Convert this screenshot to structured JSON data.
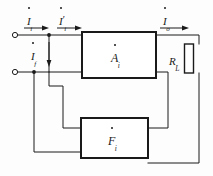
{
  "figure": {
    "type": "negative-feedback-amplifier-block-diagram",
    "background_color": "#fdfdfd",
    "line_color": "#1a1a1a"
  },
  "labels": {
    "input_current": {
      "base": "I",
      "sub": "i",
      "dot": true,
      "prime": ""
    },
    "net_input_current": {
      "base": "I",
      "sub": "i",
      "dot": true,
      "prime": "′"
    },
    "output_current": {
      "base": "I",
      "sub": "o",
      "dot": true,
      "prime": ""
    },
    "feedback_current": {
      "base": "I",
      "sub": "f",
      "dot": true,
      "prime": ""
    },
    "amplifier_block": {
      "base": "A",
      "sub": "i",
      "dot": true,
      "prime": ""
    },
    "feedback_block": {
      "base": "F",
      "sub": "i",
      "dot": true,
      "prime": ""
    },
    "load_resistor": {
      "base": "R",
      "sub": "L",
      "dot": false,
      "prime": ""
    }
  },
  "blocks": [
    {
      "name": "amplifier",
      "label_key": "amplifier_block",
      "x": 82,
      "y": 32,
      "w": 74,
      "h": 46
    },
    {
      "name": "feedback-network",
      "label_key": "feedback_block",
      "x": 81,
      "y": 118,
      "w": 67,
      "h": 40
    }
  ],
  "components": [
    {
      "name": "load-resistor",
      "label_key": "load_resistor",
      "x": 184,
      "y": 44,
      "w": 9,
      "h": 29
    }
  ],
  "terminals": [
    {
      "name": "input-terminal-top",
      "cx": 15,
      "cy": 35,
      "r": 2.6
    },
    {
      "name": "input-terminal-bottom",
      "cx": 15,
      "cy": 72,
      "r": 2.6
    }
  ],
  "junctions": [
    {
      "name": "junction-input-top",
      "cx": 49,
      "cy": 35,
      "r": 1.8
    },
    {
      "name": "junction-input-bottom",
      "cx": 34,
      "cy": 72,
      "r": 1.8
    }
  ],
  "arrows": [
    {
      "name": "arrow-input-current",
      "direction": "right",
      "x1": 24,
      "y1": 28,
      "x2": 46,
      "y2": 28
    },
    {
      "name": "arrow-net-input-current",
      "direction": "right",
      "x1": 55,
      "y1": 28,
      "x2": 80,
      "y2": 28
    },
    {
      "name": "arrow-output-current",
      "direction": "right",
      "x1": 158,
      "y1": 28,
      "x2": 186,
      "y2": 28
    },
    {
      "name": "arrow-feedback-current",
      "direction": "down",
      "x1": 49,
      "y1": 42,
      "x2": 49,
      "y2": 66
    }
  ]
}
